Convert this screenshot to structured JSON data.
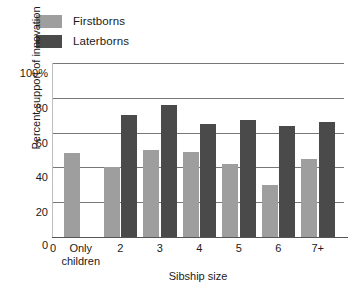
{
  "legend": {
    "entries": [
      {
        "label": "Firstborns",
        "color": "#9e9e9e",
        "icon": "legend-swatch-icon"
      },
      {
        "label": "Laterborns",
        "color": "#4a4a4a",
        "icon": "legend-swatch-icon"
      }
    ]
  },
  "axes": {
    "ylabel": "Percent support of innovation",
    "xlabel": "Sibship size",
    "yticks": [
      "100%",
      "80",
      "60",
      "40",
      "20",
      "0"
    ],
    "xticks": [
      "0",
      "Only children",
      "2",
      "3",
      "4",
      "5",
      "6",
      "7+"
    ]
  },
  "chart_data": {
    "type": "bar",
    "title": "",
    "xlabel": "Sibship size",
    "ylabel": "Percent support of innovation",
    "categories": [
      "Only children",
      "2",
      "3",
      "4",
      "5",
      "6",
      "7+"
    ],
    "series": [
      {
        "name": "Firstborns",
        "color": "#9e9e9e",
        "values": [
          48,
          40,
          50,
          49,
          42,
          30,
          45
        ]
      },
      {
        "name": "Laterborns",
        "color": "#4a4a4a",
        "values": [
          null,
          70,
          76,
          65,
          67,
          64,
          66
        ]
      }
    ],
    "ylim": [
      0,
      100
    ],
    "ytick_values": [
      0,
      20,
      40,
      60,
      80,
      100
    ],
    "grid": "horizontal",
    "legend_position": "above-plot-left"
  }
}
